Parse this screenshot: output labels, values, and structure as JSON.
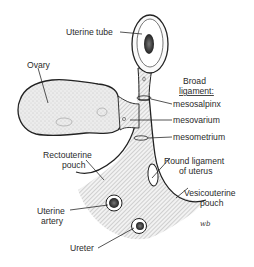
{
  "figure": {
    "type": "anatomical-diagram"
  },
  "labels": {
    "uterine_tube": "Uterine tube",
    "ovary": "Ovary",
    "broad_ligament_line1": "Broad",
    "broad_ligament_line2": "ligament:",
    "mesosalpinx": "mesosalpinx",
    "mesovarium": "mesovarium",
    "mesometrium": "mesometrium",
    "rectouterine_line1": "Rectouterine",
    "rectouterine_line2": "pouch",
    "round_ligament_line1": "Round ligament",
    "round_ligament_line2": "of uterus",
    "vesicouterine_line1": "Vesicouterine",
    "vesicouterine_line2": "pouch",
    "uterine_artery_line1": "Uterine",
    "uterine_artery_line2": "artery",
    "ureter": "Ureter",
    "artist_signature": "wb"
  },
  "colors": {
    "ink": "#222222",
    "ovary_fill": "#e6e6e6",
    "ligament_fill": "#d8d8d8",
    "lumen": "#3a3a3a"
  }
}
